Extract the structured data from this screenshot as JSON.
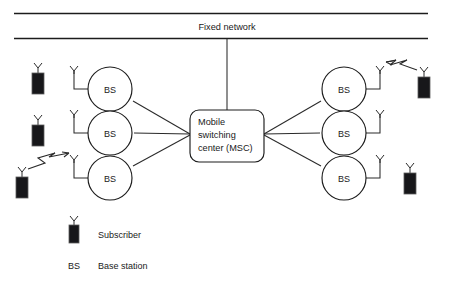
{
  "diagram": {
    "title": "Fixed network",
    "network_label": "Fixed network",
    "msc": {
      "line1": "Mobile",
      "line2": "switching",
      "line3": "center (MSC)"
    },
    "base_stations": [
      {
        "id": "bs-left-top",
        "label": "BS",
        "side": "left",
        "cx": 110,
        "cy": 89
      },
      {
        "id": "bs-left-middle",
        "label": "BS",
        "side": "left",
        "cx": 110,
        "cy": 133
      },
      {
        "id": "bs-left-bottom",
        "label": "BS",
        "side": "left",
        "cx": 110,
        "cy": 178
      },
      {
        "id": "bs-right-top",
        "label": "BS",
        "side": "right",
        "cx": 344,
        "cy": 89
      },
      {
        "id": "bs-right-middle",
        "label": "BS",
        "side": "right",
        "cx": 344,
        "cy": 133
      },
      {
        "id": "bs-right-bottom",
        "label": "BS",
        "side": "right",
        "cx": 344,
        "cy": 178
      }
    ],
    "subscribers": [
      {
        "id": "subscriber-left-top",
        "x": 38,
        "y": 68
      },
      {
        "id": "subscriber-left-middle",
        "x": 38,
        "y": 120
      },
      {
        "id": "subscriber-left-bottom",
        "x": 22,
        "y": 172
      },
      {
        "id": "subscriber-right-top",
        "x": 424,
        "y": 72
      },
      {
        "id": "subscriber-right-bottom",
        "x": 410,
        "y": 168
      }
    ],
    "radio_links": [
      {
        "id": "radio-link-left",
        "from": "subscriber-left-bottom",
        "to": "bs-left-bottom"
      },
      {
        "id": "radio-link-right",
        "from": "bs-right-top",
        "to": "subscriber-right-top"
      }
    ],
    "legend": [
      {
        "key": "",
        "label": "Subscriber",
        "symbol": "handset-icon"
      },
      {
        "key": "BS",
        "label": "Base station",
        "symbol": "text-key"
      }
    ],
    "colors": {
      "line": "#1c1c1c",
      "link": "#2a2a2a",
      "handset_fill": "#17171a",
      "background": "#ffffff",
      "text": "#1a1a1a"
    }
  }
}
